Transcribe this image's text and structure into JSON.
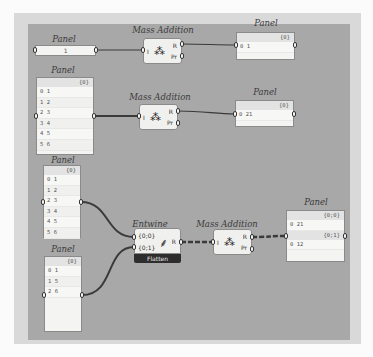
{
  "canvas": {
    "background": "#a8a8a8",
    "frame": "#d9d9d9"
  },
  "groups": [
    {
      "input_panel": {
        "label": "Panel",
        "value": "1"
      },
      "component": {
        "label": "Mass Addition",
        "inputs": [
          "I"
        ],
        "outputs": [
          "R",
          "Pr"
        ]
      },
      "output_panel": {
        "label": "Panel",
        "header": "{0}",
        "rows": [
          {
            "index": "0",
            "value": "1"
          }
        ]
      }
    },
    {
      "input_panel": {
        "label": "Panel",
        "header": "{0}",
        "rows": [
          {
            "index": "0",
            "value": "1"
          },
          {
            "index": "1",
            "value": "2"
          },
          {
            "index": "2",
            "value": "3"
          },
          {
            "index": "3",
            "value": "4"
          },
          {
            "index": "4",
            "value": "5"
          },
          {
            "index": "5",
            "value": "6"
          }
        ]
      },
      "component": {
        "label": "Mass Addition",
        "inputs": [
          "I"
        ],
        "outputs": [
          "R",
          "Pr"
        ]
      },
      "output_panel": {
        "label": "Panel",
        "header": "{0}",
        "rows": [
          {
            "index": "0",
            "value": "21"
          }
        ]
      }
    },
    {
      "input_panel_a": {
        "label": "Panel",
        "header": "{0}",
        "rows": [
          {
            "index": "0",
            "value": "1"
          },
          {
            "index": "1",
            "value": "2"
          },
          {
            "index": "2",
            "value": "3"
          },
          {
            "index": "3",
            "value": "4"
          },
          {
            "index": "4",
            "value": "5"
          },
          {
            "index": "5",
            "value": "6"
          }
        ]
      },
      "input_panel_b": {
        "label": "Panel",
        "header": "{0}",
        "rows": [
          {
            "index": "0",
            "value": "1"
          },
          {
            "index": "1",
            "value": "5"
          },
          {
            "index": "2",
            "value": "6"
          }
        ]
      },
      "entwine": {
        "label": "Entwine",
        "inputs": [
          "{0;0}",
          "{0;1}"
        ],
        "outputs": [
          "R"
        ],
        "flatten_label": "Flatten"
      },
      "component": {
        "label": "Mass Addition",
        "inputs": [
          "I"
        ],
        "outputs": [
          "R",
          "Pr"
        ]
      },
      "output_panel": {
        "label": "Panel",
        "branches": [
          {
            "header": "{0;0}",
            "rows": [
              {
                "index": "0",
                "value": "21"
              }
            ]
          },
          {
            "header": "{0;1}",
            "rows": [
              {
                "index": "0",
                "value": "12"
              }
            ]
          }
        ]
      }
    }
  ]
}
